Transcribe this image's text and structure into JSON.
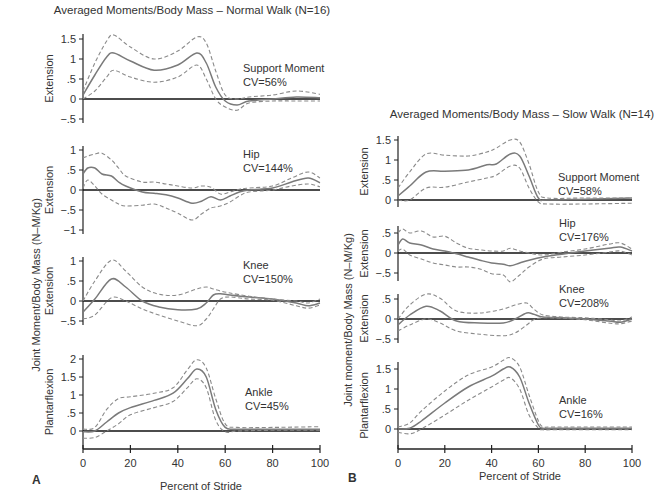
{
  "figure": {
    "panel_a": {
      "label": "A",
      "title": "Averaged Moments/Body Mass – Normal Walk (N=16)",
      "ylabel": "Joint Moment/Body Mass  (N–M/Kg)",
      "xlabel": "Percent of Stride",
      "x_ticks": [
        "0",
        "20",
        "40",
        "60",
        "80",
        "100"
      ]
    },
    "panel_b": {
      "label": "B",
      "title": "Averaged Moments/Body Mass – Slow Walk (N=14)",
      "ylabel": "Joint moment/Body Mass  (N–M/Kg)",
      "xlabel": "Percent of Stride",
      "x_ticks": [
        "0",
        "20",
        "40",
        "60",
        "80",
        "100"
      ]
    }
  },
  "chart_data": [
    {
      "type": "line",
      "panel": "A",
      "title": "Averaged Moments/Body Mass – Normal Walk (N=16)",
      "subplot": "Support Moment",
      "annotation": [
        "Support Moment",
        "CV=56%"
      ],
      "xlabel": "Percent of Stride",
      "ylabel": "Extension",
      "yticks": [
        "1.5",
        "1",
        ".5",
        "0",
        "-.5"
      ],
      "ylim": [
        -0.5,
        1.6
      ],
      "xlim": [
        0,
        100
      ],
      "x": [
        0,
        5,
        10,
        13,
        20,
        30,
        40,
        48,
        52,
        56,
        60,
        65,
        70,
        80,
        90,
        100
      ],
      "series": [
        {
          "name": "mean",
          "style": "solid",
          "values": [
            0.1,
            0.6,
            1.05,
            1.15,
            0.95,
            0.72,
            0.85,
            1.15,
            0.9,
            0.3,
            -0.05,
            -0.15,
            -0.05,
            0.0,
            0.05,
            0.03
          ]
        },
        {
          "name": "upper (+1 SD)",
          "style": "dashed",
          "values": [
            0.2,
            0.9,
            1.45,
            1.6,
            1.3,
            1.0,
            1.2,
            1.55,
            1.4,
            0.7,
            0.1,
            0.0,
            0.05,
            0.1,
            0.2,
            0.12
          ]
        },
        {
          "name": "lower (-1 SD)",
          "style": "dashed",
          "values": [
            0.0,
            0.2,
            0.55,
            0.72,
            0.55,
            0.42,
            0.55,
            0.85,
            0.5,
            0.0,
            -0.2,
            -0.28,
            -0.1,
            -0.05,
            -0.05,
            -0.05
          ]
        }
      ]
    },
    {
      "type": "line",
      "panel": "A",
      "subplot": "Hip",
      "annotation": [
        "Hip",
        "CV=144%"
      ],
      "ylabel": "Extension",
      "yticks": [
        "1",
        ".5",
        "0",
        "-.5",
        "-1"
      ],
      "ylim": [
        -1,
        1
      ],
      "xlim": [
        0,
        100
      ],
      "x": [
        0,
        2,
        5,
        8,
        12,
        15,
        18,
        25,
        30,
        35,
        40,
        46,
        50,
        54,
        58,
        62,
        66,
        70,
        80,
        88,
        95,
        100
      ],
      "series": [
        {
          "name": "mean",
          "style": "solid",
          "values": [
            0.4,
            0.55,
            0.55,
            0.4,
            0.35,
            0.2,
            0.1,
            -0.05,
            -0.08,
            -0.12,
            -0.2,
            -0.33,
            -0.28,
            -0.17,
            -0.25,
            -0.15,
            -0.05,
            0.0,
            0.05,
            0.2,
            0.3,
            0.18
          ]
        },
        {
          "name": "upper (+1 SD)",
          "style": "dashed",
          "values": [
            0.8,
            0.85,
            0.9,
            0.92,
            0.75,
            0.55,
            0.35,
            0.2,
            0.2,
            0.15,
            0.1,
            0.05,
            0.1,
            0.07,
            -0.1,
            -0.05,
            0.02,
            0.05,
            0.1,
            0.3,
            0.45,
            0.3
          ]
        },
        {
          "name": "lower (-1 SD)",
          "style": "dashed",
          "values": [
            0.05,
            0.25,
            0.1,
            -0.1,
            -0.25,
            -0.35,
            -0.4,
            -0.38,
            -0.35,
            -0.45,
            -0.58,
            -0.75,
            -0.6,
            -0.45,
            -0.4,
            -0.3,
            -0.15,
            -0.05,
            0.0,
            0.1,
            0.15,
            0.08
          ]
        }
      ]
    },
    {
      "type": "line",
      "panel": "A",
      "subplot": "Knee",
      "annotation": [
        "Knee",
        "CV=150%"
      ],
      "ylabel": "Extension",
      "yticks": [
        "1",
        ".5",
        "0",
        "-.5"
      ],
      "ylim": [
        -0.6,
        1.05
      ],
      "xlim": [
        0,
        100
      ],
      "x": [
        0,
        5,
        12,
        18,
        25,
        32,
        40,
        48,
        52,
        55,
        58,
        62,
        70,
        80,
        90,
        95,
        100
      ],
      "series": [
        {
          "name": "mean",
          "style": "solid",
          "values": [
            -0.28,
            0.05,
            0.55,
            0.35,
            0.0,
            -0.15,
            -0.22,
            -0.2,
            -0.05,
            0.15,
            0.18,
            0.15,
            0.1,
            0.05,
            -0.05,
            -0.12,
            -0.05
          ]
        },
        {
          "name": "upper (+1 SD)",
          "style": "dashed",
          "values": [
            0.0,
            0.5,
            1.02,
            0.75,
            0.35,
            0.17,
            0.15,
            0.3,
            0.35,
            0.3,
            0.25,
            0.2,
            0.12,
            0.05,
            0.0,
            -0.05,
            0.05
          ]
        },
        {
          "name": "lower (-1 SD)",
          "style": "dashed",
          "values": [
            -0.45,
            -0.35,
            0.08,
            0.0,
            -0.2,
            -0.35,
            -0.5,
            -0.62,
            -0.45,
            -0.2,
            0.05,
            0.1,
            0.05,
            0.02,
            -0.12,
            -0.18,
            -0.1
          ]
        }
      ]
    },
    {
      "type": "line",
      "panel": "A",
      "subplot": "Ankle",
      "annotation": [
        "Ankle",
        "CV=45%"
      ],
      "ylabel": "Plantarflexion",
      "yticks": [
        "2",
        "1.5",
        "1",
        ".5",
        "0"
      ],
      "ylim": [
        -0.3,
        2.05
      ],
      "xlim": [
        0,
        100
      ],
      "x": [
        0,
        5,
        10,
        15,
        20,
        30,
        38,
        44,
        48,
        52,
        56,
        60,
        65,
        80,
        100
      ],
      "series": [
        {
          "name": "mean",
          "style": "solid",
          "values": [
            -0.02,
            0.0,
            0.25,
            0.5,
            0.65,
            0.85,
            1.05,
            1.45,
            1.72,
            1.5,
            0.6,
            0.1,
            0.05,
            0.05,
            0.05
          ]
        },
        {
          "name": "upper (+1 SD)",
          "style": "dashed",
          "values": [
            0.05,
            0.1,
            0.6,
            0.9,
            0.95,
            1.05,
            1.2,
            1.7,
            1.98,
            1.75,
            0.9,
            0.2,
            0.1,
            0.1,
            0.12
          ]
        },
        {
          "name": "lower (-1 SD)",
          "style": "dashed",
          "values": [
            -0.2,
            -0.18,
            0.0,
            0.2,
            0.45,
            0.65,
            0.82,
            1.2,
            1.45,
            1.2,
            0.3,
            -0.02,
            0.0,
            0.02,
            0.02
          ]
        }
      ]
    },
    {
      "type": "line",
      "panel": "B",
      "title": "Averaged Moments/Body Mass – Slow Walk (N=14)",
      "subplot": "Support Moment",
      "annotation": [
        "Support Moment",
        "CV=58%"
      ],
      "xlabel": "Percent of Stride",
      "ylabel": "Extension",
      "yticks": [
        "1.5",
        "1",
        ".5",
        "0"
      ],
      "ylim": [
        -0.15,
        1.6
      ],
      "xlim": [
        0,
        100
      ],
      "x": [
        0,
        5,
        12,
        20,
        30,
        38,
        42,
        48,
        52,
        56,
        60,
        64,
        80,
        100
      ],
      "series": [
        {
          "name": "mean",
          "style": "solid",
          "values": [
            0.1,
            0.35,
            0.7,
            0.72,
            0.75,
            0.88,
            0.9,
            1.15,
            1.1,
            0.6,
            0.05,
            0.0,
            0.02,
            0.05
          ]
        },
        {
          "name": "upper (+1 SD)",
          "style": "dashed",
          "values": [
            0.3,
            0.7,
            1.15,
            1.12,
            1.1,
            1.2,
            1.3,
            1.5,
            1.45,
            0.9,
            0.2,
            0.05,
            0.05,
            0.05
          ]
        },
        {
          "name": "lower (-1 SD)",
          "style": "dashed",
          "values": [
            0.0,
            0.0,
            0.3,
            0.32,
            0.45,
            0.55,
            0.62,
            0.85,
            0.8,
            0.3,
            -0.05,
            -0.1,
            -0.1,
            -0.08
          ]
        }
      ]
    },
    {
      "type": "line",
      "panel": "B",
      "subplot": "Hip",
      "annotation": [
        "Hip",
        "CV=176%"
      ],
      "ylabel": "Extension",
      "yticks": [
        ".5",
        "0",
        "-.5"
      ],
      "ylim": [
        -0.75,
        0.65
      ],
      "xlim": [
        0,
        100
      ],
      "x": [
        0,
        2,
        5,
        10,
        15,
        20,
        25,
        30,
        35,
        40,
        45,
        48,
        52,
        56,
        62,
        70,
        80,
        90,
        95,
        100
      ],
      "series": [
        {
          "name": "mean",
          "style": "solid",
          "values": [
            0.2,
            0.35,
            0.25,
            0.2,
            0.1,
            0.05,
            -0.02,
            -0.1,
            -0.18,
            -0.25,
            -0.28,
            -0.32,
            -0.25,
            -0.18,
            -0.1,
            -0.03,
            0.05,
            0.12,
            0.15,
            0.05
          ]
        },
        {
          "name": "upper (+1 SD)",
          "style": "dashed",
          "values": [
            0.5,
            0.6,
            0.5,
            0.55,
            0.4,
            0.42,
            0.25,
            0.12,
            0.08,
            0.05,
            0.05,
            0.12,
            0.05,
            0.0,
            -0.05,
            0.02,
            0.1,
            0.22,
            0.25,
            0.1
          ]
        },
        {
          "name": "lower (-1 SD)",
          "style": "dashed",
          "values": [
            0.05,
            0.1,
            -0.05,
            -0.15,
            -0.25,
            -0.3,
            -0.35,
            -0.35,
            -0.4,
            -0.52,
            -0.55,
            -0.72,
            -0.55,
            -0.35,
            -0.15,
            -0.1,
            -0.05,
            0.02,
            0.05,
            -0.05
          ]
        }
      ]
    },
    {
      "type": "line",
      "panel": "B",
      "subplot": "Knee",
      "annotation": [
        "Knee",
        "CV=208%"
      ],
      "ylabel": "Extension",
      "yticks": [
        ".5",
        "0",
        "-.5"
      ],
      "ylim": [
        -0.55,
        0.65
      ],
      "xlim": [
        0,
        100
      ],
      "x": [
        0,
        5,
        12,
        18,
        25,
        35,
        45,
        50,
        55,
        58,
        62,
        70,
        80,
        90,
        95,
        100
      ],
      "series": [
        {
          "name": "mean",
          "style": "solid",
          "values": [
            -0.15,
            0.1,
            0.32,
            0.2,
            -0.05,
            -0.1,
            -0.1,
            0.0,
            0.15,
            0.12,
            0.05,
            0.03,
            0.0,
            -0.05,
            -0.08,
            0.0
          ]
        },
        {
          "name": "upper (+1 SD)",
          "style": "dashed",
          "values": [
            0.0,
            0.35,
            0.62,
            0.52,
            0.2,
            0.15,
            0.25,
            0.35,
            0.4,
            0.25,
            0.1,
            0.05,
            0.03,
            -0.02,
            -0.05,
            0.05
          ]
        },
        {
          "name": "lower (-1 SD)",
          "style": "dashed",
          "values": [
            -0.3,
            -0.15,
            0.0,
            -0.1,
            -0.3,
            -0.38,
            -0.42,
            -0.35,
            -0.15,
            -0.02,
            0.03,
            0.02,
            -0.02,
            -0.1,
            -0.12,
            -0.05
          ]
        }
      ]
    },
    {
      "type": "line",
      "panel": "B",
      "subplot": "Ankle",
      "annotation": [
        "Ankle",
        "CV=16%"
      ],
      "ylabel": "Plantarflexion",
      "yticks": [
        "1.5",
        "1",
        ".5",
        "0"
      ],
      "ylim": [
        -0.2,
        1.7
      ],
      "xlim": [
        0,
        100
      ],
      "x": [
        0,
        5,
        10,
        20,
        30,
        40,
        45,
        48,
        52,
        56,
        60,
        62,
        65,
        80,
        100
      ],
      "series": [
        {
          "name": "mean",
          "style": "solid",
          "values": [
            0.0,
            0.02,
            0.2,
            0.65,
            1.05,
            1.32,
            1.5,
            1.55,
            1.3,
            0.65,
            0.1,
            0.02,
            0.02,
            0.02,
            0.02
          ]
        },
        {
          "name": "upper (+1 SD)",
          "style": "dashed",
          "values": [
            0.05,
            0.15,
            0.45,
            0.95,
            1.35,
            1.55,
            1.72,
            1.78,
            1.55,
            0.85,
            0.2,
            0.05,
            0.05,
            0.05,
            0.05
          ]
        },
        {
          "name": "lower (-1 SD)",
          "style": "dashed",
          "values": [
            -0.08,
            -0.12,
            0.0,
            0.35,
            0.72,
            1.05,
            1.22,
            1.28,
            1.0,
            0.35,
            0.02,
            -0.02,
            -0.02,
            -0.02,
            -0.02
          ]
        }
      ]
    }
  ]
}
